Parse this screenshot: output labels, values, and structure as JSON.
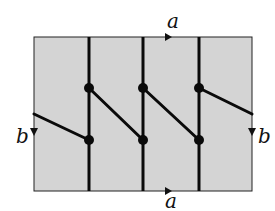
{
  "diagram": {
    "background_color": "#ffffff",
    "region_fill": "#d4d4d4",
    "line_color": "#0a0a0a",
    "labels": {
      "top": "a",
      "bottom": "a",
      "left": "b",
      "right": "b"
    },
    "rectangle": {
      "x1": 34,
      "y1": 37,
      "x2": 252,
      "y2": 191
    },
    "vertical_lines_x": [
      89,
      143,
      199
    ],
    "nodes": [
      {
        "x": 89,
        "y": 88
      },
      {
        "x": 89,
        "y": 140
      },
      {
        "x": 143,
        "y": 88
      },
      {
        "x": 143,
        "y": 140
      },
      {
        "x": 199,
        "y": 88
      },
      {
        "x": 199,
        "y": 140
      }
    ],
    "diagonal_edges": [
      {
        "from": [
          34,
          114
        ],
        "to": [
          89,
          140
        ]
      },
      {
        "from": [
          89,
          88
        ],
        "to": [
          143,
          140
        ]
      },
      {
        "from": [
          143,
          88
        ],
        "to": [
          199,
          140
        ]
      },
      {
        "from": [
          199,
          88
        ],
        "to": [
          252,
          114
        ]
      }
    ]
  }
}
